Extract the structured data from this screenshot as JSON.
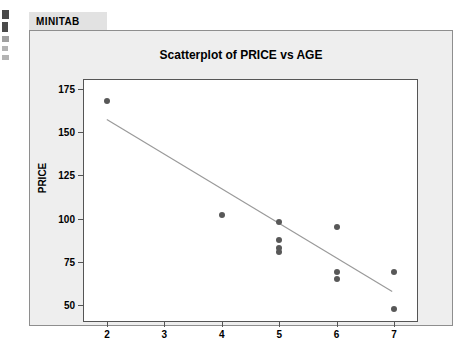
{
  "tab": {
    "label": "MINITAB"
  },
  "chart_data": {
    "type": "scatter",
    "title": "Scatterplot of PRICE vs AGE",
    "xlabel": "AGE",
    "ylabel": "PRICE",
    "xlim": [
      1.6,
      7.4
    ],
    "ylim": [
      41,
      180
    ],
    "xticks": [
      "2",
      "3",
      "4",
      "5",
      "6",
      "7"
    ],
    "xtick_values": [
      2,
      3,
      4,
      5,
      6,
      7
    ],
    "yticks": [
      "50",
      "75",
      "100",
      "125",
      "150",
      "175"
    ],
    "ytick_values": [
      50,
      75,
      100,
      125,
      150,
      175
    ],
    "grid": false,
    "legend": "none",
    "series": [
      {
        "name": "PRICE vs AGE",
        "marker": "filled-circle",
        "color": "#585858",
        "points": [
          {
            "x": 2,
            "y": 168
          },
          {
            "x": 4,
            "y": 102
          },
          {
            "x": 5,
            "y": 98
          },
          {
            "x": 5,
            "y": 88
          },
          {
            "x": 5,
            "y": 83
          },
          {
            "x": 5,
            "y": 81
          },
          {
            "x": 6,
            "y": 95
          },
          {
            "x": 6,
            "y": 69
          },
          {
            "x": 6,
            "y": 65
          },
          {
            "x": 7,
            "y": 69
          },
          {
            "x": 7,
            "y": 48
          }
        ]
      }
    ],
    "fit_line": {
      "name": "regression-line",
      "color": "#9a9a9a",
      "x_start": 2,
      "y_start": 157,
      "x_end": 7,
      "y_end": 57
    }
  }
}
